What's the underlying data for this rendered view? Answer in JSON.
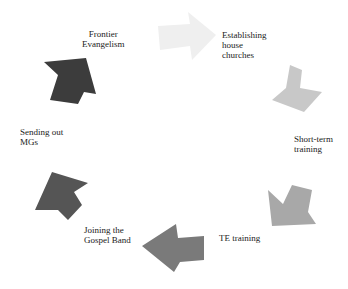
{
  "diagram": {
    "type": "cycle",
    "steps": [
      {
        "label": "Frontier\nEvangelism",
        "color": "#3c3c3c"
      },
      {
        "label": "Establishing\nhouse\nchurches",
        "color": "#efefef"
      },
      {
        "label": "Short-term\ntraining",
        "color": "#c4c4c4"
      },
      {
        "label": "TE training",
        "color": "#a6a6a6"
      },
      {
        "label": "Joining the\nGospel Band",
        "color": "#7a7a7a"
      },
      {
        "label": "Sending out\nMGs",
        "color": "#555555"
      }
    ]
  }
}
